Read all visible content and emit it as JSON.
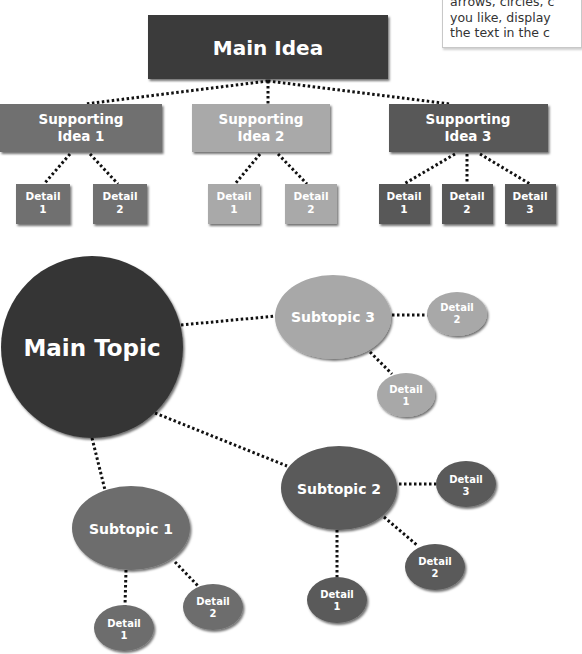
{
  "callout": {
    "lines": [
      "arrows, circles, c",
      "you like, display",
      "the text in the c"
    ]
  },
  "hierarchy": {
    "main": {
      "label": "Main Idea",
      "color": "#3b3b3b"
    },
    "supporting": [
      {
        "line1": "Supporting",
        "line2": "Idea 1",
        "color": "#6f6f6f",
        "details": [
          {
            "line1": "Detail",
            "line2": "1"
          },
          {
            "line1": "Detail",
            "line2": "2"
          }
        ]
      },
      {
        "line1": "Supporting",
        "line2": "Idea 2",
        "color": "#a9a9a9",
        "details": [
          {
            "line1": "Detail",
            "line2": "1"
          },
          {
            "line1": "Detail",
            "line2": "2"
          }
        ]
      },
      {
        "line1": "Supporting",
        "line2": "Idea 3",
        "color": "#585858",
        "details": [
          {
            "line1": "Detail",
            "line2": "1"
          },
          {
            "line1": "Detail",
            "line2": "2"
          },
          {
            "line1": "Detail",
            "line2": "3"
          }
        ]
      }
    ]
  },
  "mindmap": {
    "main": {
      "label": "Main Topic",
      "color": "#353535"
    },
    "subtopics": [
      {
        "label": "Subtopic 1",
        "color": "#6d6d6d",
        "details": [
          {
            "line1": "Detail",
            "line2": "1"
          },
          {
            "line1": "Detail",
            "line2": "2"
          }
        ]
      },
      {
        "label": "Subtopic 2",
        "color": "#5a5a5a",
        "details": [
          {
            "line1": "Detail",
            "line2": "1"
          },
          {
            "line1": "Detail",
            "line2": "2"
          },
          {
            "line1": "Detail",
            "line2": "3"
          }
        ]
      },
      {
        "label": "Subtopic 3",
        "color": "#a8a8a8",
        "details": [
          {
            "line1": "Detail",
            "line2": "1"
          },
          {
            "line1": "Detail",
            "line2": "2"
          }
        ]
      }
    ]
  }
}
